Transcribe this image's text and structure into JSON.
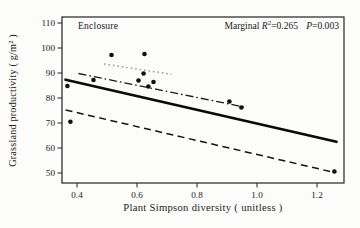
{
  "chart_data": {
    "type": "scatter",
    "title": "",
    "annotations": {
      "group_label": "Enclosure",
      "stats": {
        "prefix": "Marginal ",
        "r_symbol": "R",
        "r_exponent": "2",
        "r_value": "=0.265",
        "p_symbol": "P",
        "p_value": "=0.003"
      }
    },
    "xlabel": "Plant Simpson diversity ( unitless )",
    "ylabel": "Grassland productivity ( g/m² )",
    "xlim": [
      0.35,
      1.29
    ],
    "ylim": [
      46,
      112.4
    ],
    "xticks": [
      "0.4",
      "0.6",
      "0.8",
      "1.0",
      "1.2"
    ],
    "yticks": [
      "50",
      "60",
      "70",
      "80",
      "90",
      "100",
      "110"
    ],
    "grid": false,
    "legend": "none",
    "point_color": "#101010",
    "frame_color": "#222222",
    "points": [
      [
        0.368,
        84.8
      ],
      [
        0.378,
        70.5
      ],
      [
        0.455,
        87.2
      ],
      [
        0.515,
        97.2
      ],
      [
        0.625,
        97.6
      ],
      [
        0.605,
        87.0
      ],
      [
        0.622,
        89.8
      ],
      [
        0.638,
        84.6
      ],
      [
        0.655,
        86.4
      ],
      [
        0.908,
        78.6
      ],
      [
        0.948,
        76.2
      ],
      [
        1.258,
        50.6
      ]
    ],
    "lines": [
      {
        "id": "solid-overall-trend-line",
        "style": "solid",
        "color": "#0a0a0a",
        "width": 2.8,
        "x1": 0.362,
        "y1": 87.3,
        "x2": 1.265,
        "y2": 62.5
      },
      {
        "id": "dashed-trend-line",
        "style": "dashed",
        "color": "#141414",
        "width": 1.5,
        "x1": 0.362,
        "y1": 75.2,
        "x2": 1.255,
        "y2": 50.3
      },
      {
        "id": "dashdot-trend-line",
        "style": "dashdot",
        "color": "#1a1a1a",
        "width": 1.3,
        "x1": 0.405,
        "y1": 89.8,
        "x2": 0.965,
        "y2": 76.2
      },
      {
        "id": "dotted-trend-line",
        "style": "dotted",
        "color": "#9b9b9b",
        "width": 1.5,
        "x1": 0.49,
        "y1": 93.6,
        "x2": 0.715,
        "y2": 89.5
      }
    ]
  }
}
